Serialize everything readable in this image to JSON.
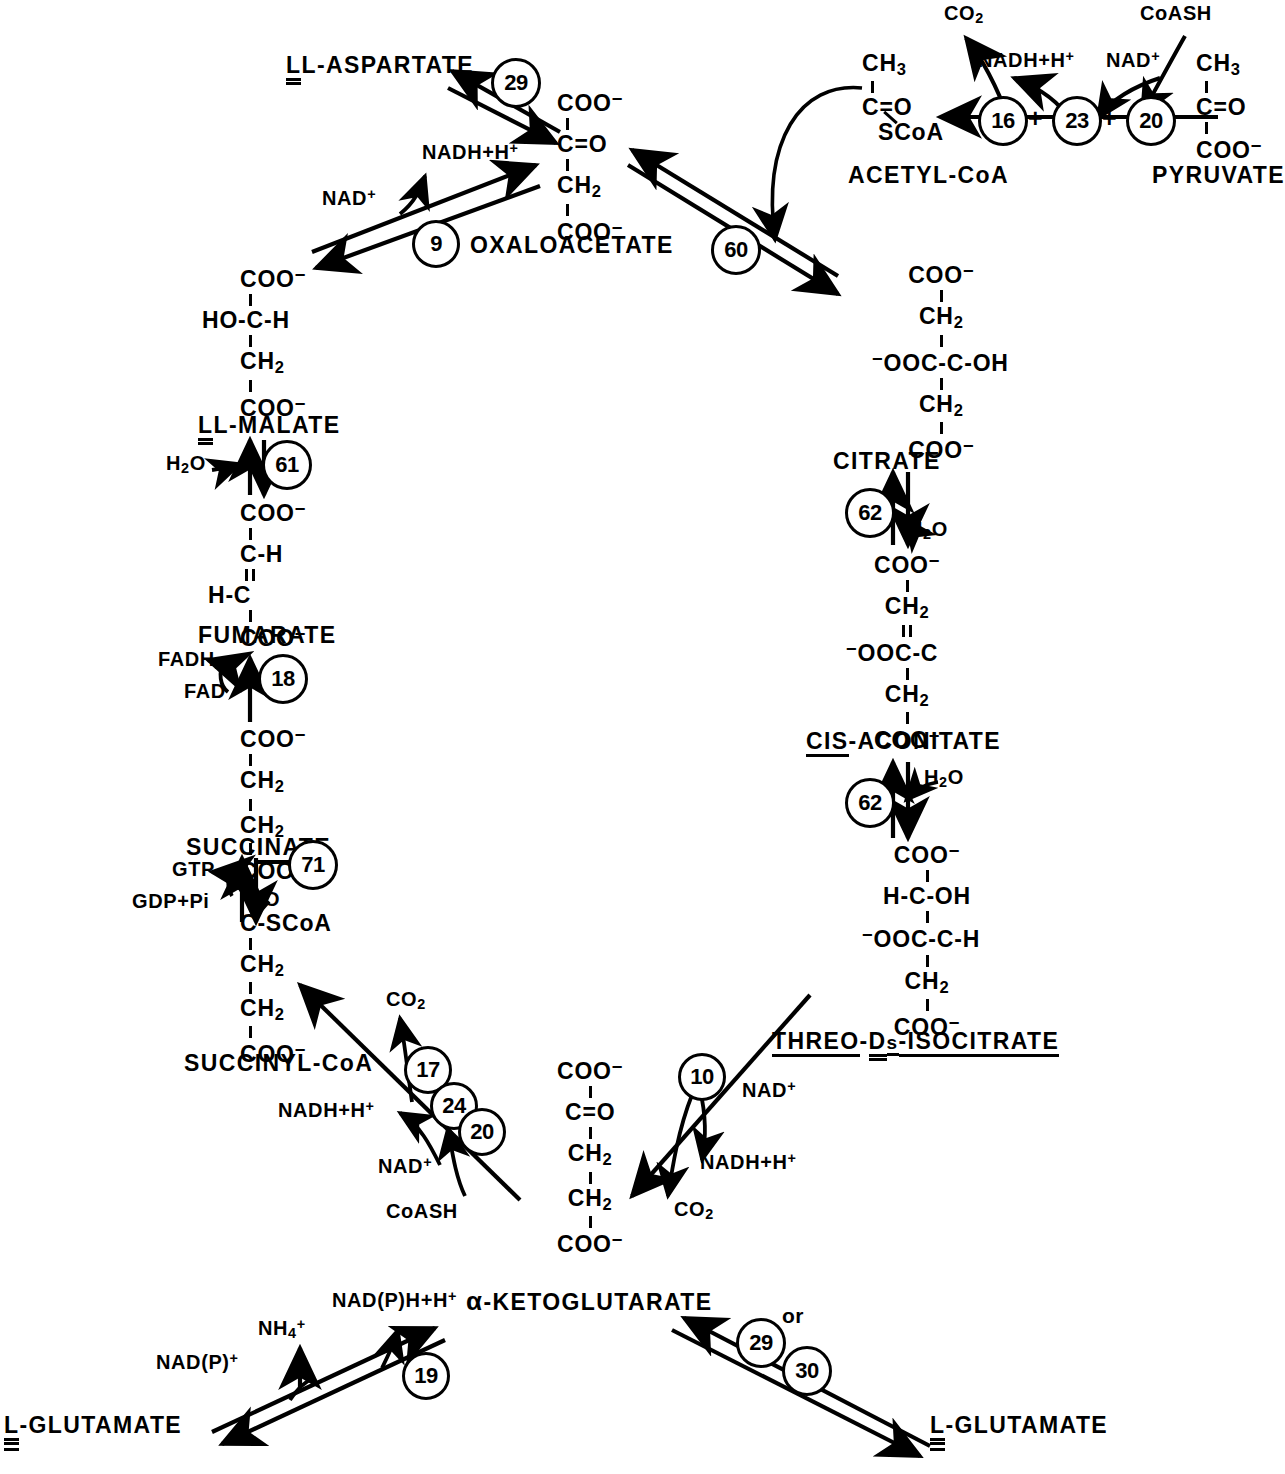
{
  "diagram": {
    "type": "biochemical-pathway"
  },
  "metabolites": {
    "l_aspartate": "L-ASPARTATE",
    "oxaloacetate": "OXALOACETATE",
    "acetyl_coa": "ACETYL-CoA",
    "pyruvate": "PYRUVATE",
    "citrate": "CITRATE",
    "cis_aconitate_prefix": "CIS",
    "cis_aconitate_rest": "-ACONITATE",
    "isocitrate_threo": "THREO",
    "isocitrate_d": "D",
    "isocitrate_s": "s",
    "isocitrate_rest": "-ISOCITRATE",
    "l_malate": "L-MALATE",
    "fumarate": "FUMARATE",
    "succinate": "SUCCINATE",
    "succinyl_coa": "SUCCINYL-CoA",
    "alpha_ketoglutarate": "-KETOGLUTARATE",
    "alpha_symbol": "α",
    "l_glutamate_left": "-GLUTAMATE",
    "l_glutamate_right": "-GLUTAMATE",
    "l_prefix": "L"
  },
  "cofactors": {
    "nad_plus": "NAD",
    "nadh_h": "NADH+H",
    "nadp_plus": "NAD(P)",
    "nadph_h": "NAD(P)H+H",
    "fad": "FAD",
    "fadh2": "FADH",
    "co2": "CO",
    "coash": "CoASH",
    "h2o": "H",
    "gtp": "GTP",
    "gdp_pi": "GDP+Pi",
    "nh4_plus": "NH",
    "plus_sign": "+",
    "or_text": "or"
  },
  "enzymes": [
    {
      "id": "e29a",
      "number": "29",
      "reaction": "aspartate-aminotransferase"
    },
    {
      "id": "e9",
      "number": "9",
      "reaction": "malate-dehydrogenase"
    },
    {
      "id": "e60",
      "number": "60",
      "reaction": "citrate-synthase"
    },
    {
      "id": "e16",
      "number": "16",
      "reaction": "pyruvate-dehydrogenase"
    },
    {
      "id": "e23",
      "number": "23",
      "reaction": "dihydrolipoyl-transacetylase"
    },
    {
      "id": "e20a",
      "number": "20",
      "reaction": "dihydrolipoyl-dehydrogenase"
    },
    {
      "id": "e62a",
      "number": "62",
      "reaction": "aconitase"
    },
    {
      "id": "e62b",
      "number": "62",
      "reaction": "aconitase"
    },
    {
      "id": "e61",
      "number": "61",
      "reaction": "fumarase"
    },
    {
      "id": "e18",
      "number": "18",
      "reaction": "succinate-dehydrogenase"
    },
    {
      "id": "e71",
      "number": "71",
      "reaction": "succinyl-coa-synthetase"
    },
    {
      "id": "e17",
      "number": "17",
      "reaction": "alpha-ketoglutarate-dehydrogenase"
    },
    {
      "id": "e24",
      "number": "24",
      "reaction": "dihydrolipoyl-succinyltransferase"
    },
    {
      "id": "e20b",
      "number": "20",
      "reaction": "dihydrolipoyl-dehydrogenase"
    },
    {
      "id": "e10",
      "number": "10",
      "reaction": "isocitrate-dehydrogenase"
    },
    {
      "id": "e19",
      "number": "19",
      "reaction": "glutamate-dehydrogenase"
    },
    {
      "id": "e29b",
      "number": "29",
      "reaction": "aspartate-aminotransferase"
    },
    {
      "id": "e30",
      "number": "30",
      "reaction": "alanine-aminotransferase"
    }
  ],
  "structures": {
    "oxaloacetate": [
      "COO",
      "C=O",
      "CH",
      "COO"
    ],
    "citrate": [
      "COO",
      "CH",
      "OOC-C-OH",
      "CH",
      "COO"
    ],
    "cis_aconitate": [
      "COO",
      "CH",
      "OOC-C",
      "CH",
      "COO"
    ],
    "isocitrate": [
      "COO",
      "H-C-OH",
      "OOC-C-H",
      "CH",
      "COO"
    ],
    "alpha_ketoglutarate": [
      "COO",
      "C=O",
      "CH",
      "CH",
      "COO"
    ],
    "succinyl_coa": [
      "C-SCoA",
      "CH",
      "CH",
      "COO"
    ],
    "succinate": [
      "COO",
      "CH",
      "CH",
      "COO"
    ],
    "fumarate": [
      "COO",
      "C-H",
      "H-C",
      "COO"
    ],
    "l_malate": [
      "COO",
      "HO-C-H",
      "CH",
      "COO"
    ],
    "acetyl_coa": [
      "CH",
      "C=O",
      "SCoA"
    ],
    "pyruvate": [
      "CH",
      "C=O",
      "COO"
    ]
  }
}
